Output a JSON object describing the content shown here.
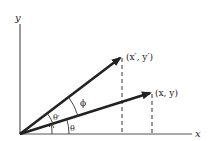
{
  "diagram": {
    "type": "vector-rotation",
    "axes": {
      "x_label": "x",
      "y_label": "y"
    },
    "vectors": [
      {
        "name": "original",
        "label": "(x, y)",
        "tip": [
          152,
          93
        ]
      },
      {
        "name": "rotated",
        "label": "(x′, y′)",
        "tip": [
          122,
          57
        ]
      }
    ],
    "angles": {
      "theta": "θ",
      "theta_prime": "θ′",
      "phi": "ϕ"
    },
    "colors": {
      "ink": "#222222",
      "axis": "#555555",
      "background": "#ffffff"
    }
  }
}
